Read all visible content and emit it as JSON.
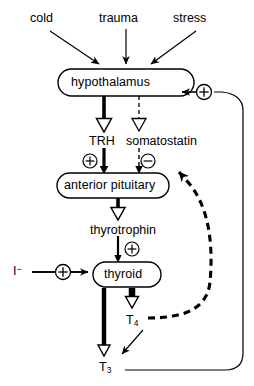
{
  "diagram": {
    "colors": {
      "ink": "#000000",
      "background": "#ffffff"
    },
    "stimuli": [
      {
        "id": "cold",
        "label": "cold",
        "x": 47,
        "y": 18
      },
      {
        "id": "trauma",
        "label": "trauma",
        "x": 125,
        "y": 18
      },
      {
        "id": "stress",
        "label": "stress",
        "x": 198,
        "y": 18
      }
    ],
    "nodes": [
      {
        "id": "hypothalamus",
        "label": "hypothalamus",
        "x": 126,
        "y": 82,
        "w": 136,
        "h": 27
      },
      {
        "id": "anterior-pituitary",
        "label": "anterior pituitary",
        "x": 113,
        "y": 185,
        "w": 112,
        "h": 25
      },
      {
        "id": "thyroid",
        "label": "thyroid",
        "x": 127,
        "y": 274,
        "w": 68,
        "h": 25
      }
    ],
    "mediators": [
      {
        "id": "trh",
        "label": "TRH",
        "x": 106,
        "y": 141
      },
      {
        "id": "somatostatin",
        "label": "somatostatin",
        "x": 165,
        "y": 141
      },
      {
        "id": "thyrotrophin",
        "label": "thyrotrophin",
        "x": 127,
        "y": 230
      }
    ],
    "hormones": [
      {
        "id": "t4",
        "label": "T",
        "subscript": "4",
        "x": 133,
        "y": 320
      },
      {
        "id": "t3",
        "label": "T",
        "subscript": "3",
        "x": 105,
        "y": 367
      }
    ],
    "substrates": [
      {
        "id": "iodide",
        "label": "I",
        "superscript": "−",
        "x": 16,
        "y": 271
      }
    ],
    "signs": [
      {
        "id": "sign-trh-plus",
        "symbol": "+",
        "x": 90,
        "y": 161
      },
      {
        "id": "sign-somatostatin-minus",
        "symbol": "−",
        "x": 148,
        "y": 161
      },
      {
        "id": "sign-thyrotrophin-plus",
        "symbol": "+",
        "x": 132,
        "y": 249
      },
      {
        "id": "sign-iodide-plus",
        "symbol": "+",
        "x": 63,
        "y": 272
      },
      {
        "id": "sign-feedback-plus",
        "symbol": "+",
        "x": 204,
        "y": 92
      }
    ],
    "edges": [
      {
        "id": "cold-to-hypothalamus",
        "style": "solid-thin",
        "from": "cold",
        "to": "hypothalamus"
      },
      {
        "id": "trauma-to-hypothalamus",
        "style": "solid-thin",
        "from": "trauma",
        "to": "hypothalamus"
      },
      {
        "id": "stress-to-hypothalamus",
        "style": "solid-thin",
        "from": "stress",
        "to": "hypothalamus"
      },
      {
        "id": "hypothalamus-to-trh",
        "style": "solid-thick",
        "from": "hypothalamus",
        "to": "trh"
      },
      {
        "id": "hypothalamus-to-somatostatin",
        "style": "dashed-thin",
        "from": "hypothalamus",
        "to": "somatostatin"
      },
      {
        "id": "trh-to-anterior-pituitary",
        "style": "solid-thick",
        "from": "trh",
        "to": "anterior-pituitary"
      },
      {
        "id": "somatostatin-to-anterior-pituitary",
        "style": "dashed-thin",
        "from": "somatostatin",
        "to": "anterior-pituitary"
      },
      {
        "id": "anterior-pituitary-to-thyrotrophin",
        "style": "solid-thick",
        "from": "anterior-pituitary",
        "to": "thyrotrophin"
      },
      {
        "id": "thyrotrophin-to-thyroid",
        "style": "solid-thin",
        "from": "thyrotrophin",
        "to": "thyroid"
      },
      {
        "id": "iodide-to-thyroid",
        "style": "solid-thin",
        "from": "iodide",
        "to": "thyroid"
      },
      {
        "id": "thyroid-to-t3",
        "style": "solid-thick",
        "from": "thyroid",
        "to": "t3"
      },
      {
        "id": "thyroid-to-t4",
        "style": "solid-thick",
        "from": "thyroid",
        "to": "t4"
      },
      {
        "id": "t4-to-t3",
        "style": "solid-thin",
        "from": "t4",
        "to": "t3"
      },
      {
        "id": "t4-feedback-anterior-pituitary",
        "style": "dashed-bold",
        "from": "t4",
        "to": "anterior-pituitary"
      },
      {
        "id": "t3-feedback-hypothalamus",
        "style": "solid-thin",
        "from": "t3",
        "to": "hypothalamus"
      }
    ]
  }
}
